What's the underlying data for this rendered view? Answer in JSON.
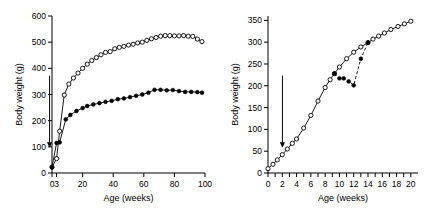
{
  "figure": {
    "panels": [
      {
        "id": "left",
        "annotation": {
          "label": "Weaning",
          "at_week": 3
        }
      },
      {
        "id": "right",
        "annotation": {
          "label": "Weaning",
          "at_week": 3
        }
      }
    ]
  },
  "chart_data": [
    {
      "type": "line",
      "panel": "left",
      "title": "",
      "xlabel": "Age (weeks)",
      "ylabel": "Body weight (g)",
      "xlim": [
        0,
        100
      ],
      "ylim": [
        0,
        600
      ],
      "xticks": [
        0,
        3,
        20,
        40,
        60,
        80,
        100
      ],
      "xtick_labels": [
        "0",
        "3",
        "20",
        "40",
        "60",
        "80",
        "100"
      ],
      "yticks": [
        0,
        100,
        200,
        300,
        400,
        500,
        600
      ],
      "ytick_labels": [
        "0",
        "100",
        "200",
        "300",
        "400",
        "500",
        "600"
      ],
      "grid": false,
      "legend": null,
      "annotations": [
        {
          "text": "Weaning",
          "x_week": 3,
          "rotation": -90,
          "arrow": "down"
        }
      ],
      "series": [
        {
          "name": "open-circles-upper",
          "marker": "open-circle",
          "linestyle": "solid",
          "x": [
            0,
            3,
            5,
            8,
            11,
            14,
            17,
            20,
            23,
            26,
            29,
            32,
            35,
            38,
            41,
            44,
            47,
            50,
            53,
            56,
            59,
            62,
            65,
            68,
            71,
            74,
            77,
            80,
            83,
            86,
            89,
            92,
            95,
            98
          ],
          "y": [
            22,
            55,
            160,
            298,
            340,
            363,
            382,
            400,
            416,
            430,
            441,
            452,
            461,
            464,
            475,
            480,
            484,
            489,
            492,
            497,
            500,
            507,
            513,
            518,
            523,
            525,
            525,
            524,
            524,
            525,
            523,
            522,
            512,
            502
          ]
        },
        {
          "name": "filled-circles-lower",
          "marker": "filled-circle",
          "linestyle": "solid",
          "x": [
            0,
            3,
            5,
            9,
            12,
            16,
            20,
            23,
            27,
            31,
            35,
            39,
            43,
            47,
            51,
            55,
            59,
            63,
            67,
            71,
            75,
            79,
            83,
            87,
            91,
            95,
            98
          ],
          "y": [
            22,
            115,
            117,
            205,
            222,
            237,
            248,
            256,
            262,
            267,
            272,
            276,
            282,
            285,
            290,
            295,
            300,
            307,
            318,
            318,
            316,
            317,
            313,
            310,
            310,
            309,
            307
          ]
        }
      ]
    },
    {
      "type": "line",
      "panel": "right",
      "title": "",
      "xlabel": "Age (weeks)",
      "ylabel": "Body weight (g)",
      "xlim": [
        0,
        21
      ],
      "ylim": [
        0,
        360
      ],
      "xticks": [
        0,
        1,
        2,
        3,
        4,
        5,
        6,
        7,
        8,
        9,
        10,
        11,
        12,
        13,
        14,
        15,
        16,
        17,
        18,
        19,
        20
      ],
      "xtick_labels": [
        "0",
        "2",
        "4",
        "6",
        "8",
        "10",
        "12",
        "14",
        "16",
        "18",
        "20"
      ],
      "labeled_xticks": [
        0,
        2,
        4,
        6,
        8,
        10,
        12,
        14,
        16,
        18,
        20
      ],
      "yticks": [
        0,
        50,
        100,
        150,
        200,
        250,
        300,
        350
      ],
      "ytick_labels": [
        "0",
        "50",
        "100",
        "150",
        "200",
        "250",
        "300",
        "350"
      ],
      "grid": false,
      "legend": null,
      "annotations": [
        {
          "text": "Weaning",
          "x_week": 3,
          "rotation": -90,
          "arrow": "down"
        }
      ],
      "series": [
        {
          "name": "open-circles-control",
          "marker": "open-circle",
          "linestyle": "solid",
          "x": [
            0,
            0.7,
            1.3,
            2,
            2.7,
            3.4,
            4,
            5,
            6,
            7,
            8,
            8.7,
            9.3,
            10,
            11,
            12,
            13,
            14,
            14.7,
            15.5,
            16.3,
            17.2,
            18.2,
            19.1,
            20
          ],
          "y": [
            10,
            20,
            30,
            42,
            55,
            68,
            78,
            103,
            132,
            165,
            196,
            214,
            228,
            243,
            262,
            277,
            289,
            299,
            307,
            314,
            321,
            329,
            336,
            342,
            348
          ]
        },
        {
          "name": "filled-circles-restricted",
          "marker": "filled-circle",
          "linestyle": "dashed",
          "x": [
            9.3,
            10,
            10.6,
            11.3,
            12,
            13,
            14
          ],
          "y": [
            228,
            217,
            217,
            210,
            201,
            262,
            299
          ]
        }
      ]
    }
  ]
}
